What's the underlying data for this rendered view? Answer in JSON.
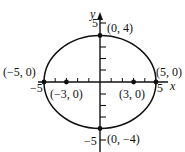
{
  "diagram": {
    "type": "ellipse-graph",
    "equation_params": {
      "a": 5,
      "b": 4,
      "c": 3,
      "center": [
        0,
        0
      ]
    },
    "axes": {
      "x_label": "x",
      "y_label": "y",
      "x_ticks": {
        "neg_label": "−5",
        "pos_label": "5",
        "range": [
          -5,
          5
        ]
      },
      "y_ticks": {
        "neg_label": "−5",
        "pos_label": "5",
        "range": [
          -5,
          5
        ]
      }
    },
    "points": [
      {
        "id": "vertex-left",
        "x": -5,
        "y": 0,
        "label": "(−5, 0)"
      },
      {
        "id": "vertex-right",
        "x": 5,
        "y": 0,
        "label": "(5, 0)"
      },
      {
        "id": "covertex-top",
        "x": 0,
        "y": 4,
        "label": "(0, 4)"
      },
      {
        "id": "covertex-bottom",
        "x": 0,
        "y": -4,
        "label": "(0, −4)"
      },
      {
        "id": "focus-left",
        "x": -3,
        "y": 0,
        "label": "(−3, 0)"
      },
      {
        "id": "focus-right",
        "x": 3,
        "y": 0,
        "label": "(3, 0)"
      }
    ],
    "colors": {
      "stroke": "#111111",
      "background": "#ffffff"
    }
  }
}
